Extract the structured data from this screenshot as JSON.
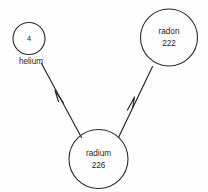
{
  "diagram": {
    "background_color": "#fefefe",
    "stroke_color": "#2b2b2b",
    "nodes": [
      {
        "id": "helium",
        "name_label": "",
        "mass_number": "4",
        "outside_label": "helium",
        "cx": 29,
        "cy": 38.5,
        "r": 16
      },
      {
        "id": "radon",
        "name_label": "radon",
        "mass_number": "222",
        "outside_label": "",
        "cx": 169,
        "cy": 37.5,
        "r": 28.5
      },
      {
        "id": "radium",
        "name_label": "radium",
        "mass_number": "226",
        "outside_label": "",
        "cx": 98.5,
        "cy": 159,
        "r": 29.5
      }
    ],
    "edges": [
      {
        "id": "radium-to-helium",
        "from": "radium",
        "to": "helium",
        "arrow_position_label": "mid"
      },
      {
        "id": "radium-to-radon",
        "from": "radium",
        "to": "radon",
        "arrow_position_label": "mid"
      }
    ]
  }
}
